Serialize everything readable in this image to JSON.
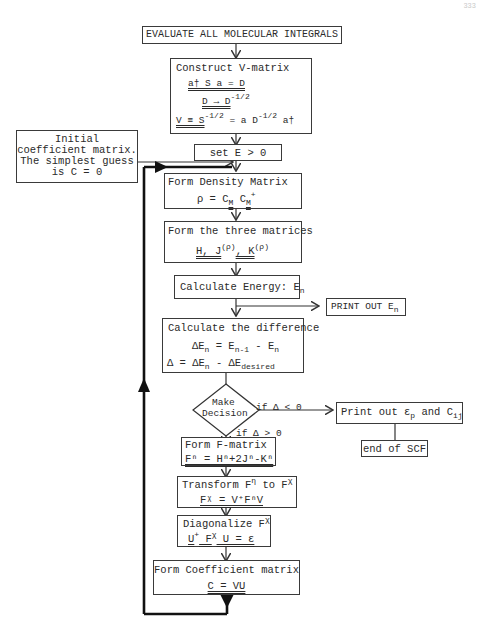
{
  "page_number": "333",
  "flowchart": {
    "title": "SCF procedure flowchart",
    "nodes": {
      "evaluate": {
        "label": "EVALUATE ALL MOLECULAR INTEGRALS"
      },
      "construct_v": {
        "label": "Construct V-matrix",
        "eq1": "a† S a = D",
        "eq2": "D → D",
        "eq2_sup": "-1/2",
        "eq3_lhs": "V ≡ S",
        "eq3_sup1": "-1/2",
        "eq3_mid": " = a D",
        "eq3_sup2": "-1/2",
        "eq3_end": " a†"
      },
      "initial_guess": {
        "line1": "Initial",
        "line2": "coefficient matrix.",
        "line3": "The simplest guess",
        "line4": "is C = 0"
      },
      "set_e": {
        "label": "set E > 0"
      },
      "density": {
        "label": "Form Density Matrix",
        "eq": "ρ = C",
        "sub1": "M",
        "mid": " C",
        "sub2": "M",
        "sup": "+"
      },
      "three_matrices": {
        "label": "Form the three matrices",
        "eq_h": "H, J",
        "sup1": "(ρ)",
        "eq_k": ", K",
        "sup2": "(ρ)"
      },
      "energy": {
        "label": "Calculate Energy: E",
        "sub": "n"
      },
      "print_energy": {
        "label": "PRINT OUT E",
        "sub": "n"
      },
      "difference": {
        "label": "Calculate the difference",
        "eq1_a": "ΔE",
        "eq1_sub1": "n",
        "eq1_b": " = E",
        "eq1_sub2": "n-1",
        "eq1_c": " - E",
        "eq1_sub3": "n",
        "eq2_a": "Δ  = ΔE",
        "eq2_sub1": "n",
        "eq2_b": " - ΔE",
        "eq2_sub2": "desired"
      },
      "decision": {
        "line1": "Make",
        "line2": "Decision"
      },
      "print_results": {
        "label_a": "Print out ε",
        "sub1": "p",
        "label_b": " and C",
        "sub2": "ij"
      },
      "end_scf": {
        "label": "end of SCF"
      },
      "form_f": {
        "label": "Form F-matrix",
        "eq": "Fⁿ = Hⁿ+2Jⁿ-Kⁿ"
      },
      "transform": {
        "label_a": "Transform F",
        "sup1": "η",
        "label_b": " to F",
        "sup2": "χ",
        "eq": "Fᵡ = V⁺FⁿV"
      },
      "diagonalize": {
        "label": "Diagonalize F",
        "sup": "χ",
        "eq_a": "U",
        "eq_sup1": "+",
        "eq_b": " F",
        "eq_sup2": "χ",
        "eq_c": " U = ε"
      },
      "coefficient": {
        "label": "Form Coefficient matrix",
        "eq": "C = VU"
      }
    },
    "edge_labels": {
      "if_less": "if Δ < 0",
      "if_greater": "if Δ > 0"
    }
  }
}
